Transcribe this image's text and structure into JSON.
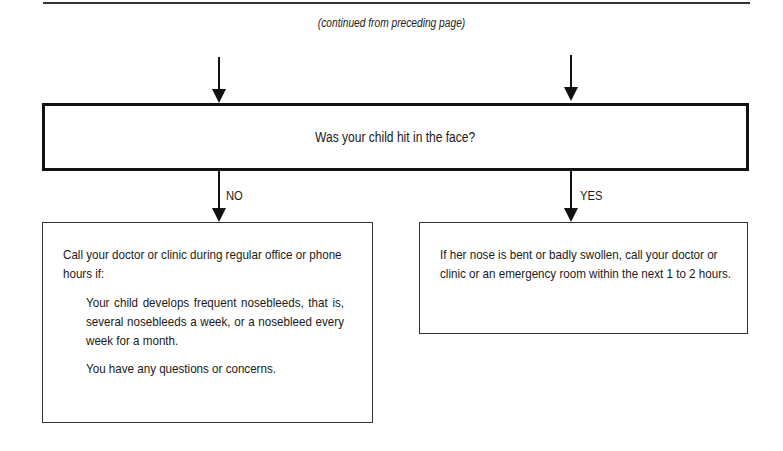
{
  "page": {
    "continued_note": "(continued from preceding page)"
  },
  "flowchart": {
    "question": "Was your child hit in the face?",
    "branches": {
      "no": {
        "label": "NO",
        "intro": "Call your doctor or clinic during regular office or phone hours if:",
        "conditions": [
          "Your child develops frequent nosebleeds, that is, several nosebleeds a week, or a nosebleed every week for a month.",
          "You have any questions or concerns."
        ]
      },
      "yes": {
        "label": "YES",
        "advice": "If her nose is bent or badly swollen, call your doctor or clinic or an emergency room within the next 1 to 2 hours."
      }
    }
  }
}
